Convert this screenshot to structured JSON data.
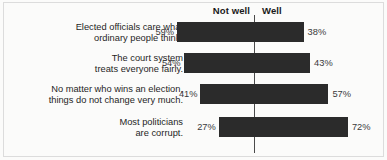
{
  "chart_data": {
    "type": "bar",
    "subtype": "diverging-horizontal",
    "title": "",
    "xlabel": "",
    "ylabel": "",
    "grid": false,
    "legend_position": "top",
    "axis_center_value": 0,
    "value_unit": "%",
    "headers": {
      "left": "Not well",
      "right": "Well"
    },
    "categories": [
      "Elected officials care what\nordinary people think.",
      "The court system\ntreats everyone fairly.",
      "No matter who wins an election,\nthings do not change very much.",
      "Most politicians\nare corrupt."
    ],
    "series": [
      {
        "name": "Not well",
        "values": [
          59,
          54,
          41,
          27
        ],
        "direction": "left",
        "color": "#2b2b2b"
      },
      {
        "name": "Well",
        "values": [
          38,
          43,
          57,
          72
        ],
        "direction": "right",
        "color": "#2b2b2b"
      }
    ],
    "labels": {
      "left": [
        "59%",
        "54%",
        "41%",
        "27%"
      ],
      "right": [
        "38%",
        "43%",
        "57%",
        "72%"
      ]
    },
    "rows": [
      {
        "label": "Elected officials care what\nordinary people think.",
        "left_value": 59,
        "left_label": "59%",
        "right_value": 38,
        "right_label": "38%"
      },
      {
        "label": "The court system\ntreats everyone fairly.",
        "left_value": 54,
        "left_label": "54%",
        "right_value": 43,
        "right_label": "43%"
      },
      {
        "label": "No matter who wins an election,\nthings do not change very much.",
        "left_value": 41,
        "left_label": "41%",
        "right_value": 57,
        "right_label": "57%"
      },
      {
        "label": "Most politicians\nare corrupt.",
        "left_value": 27,
        "left_label": "27%",
        "right_value": 72,
        "right_label": "72%"
      }
    ]
  },
  "style": {
    "bar_color": "#2b2b2b",
    "axis_color": "#4a4a4a",
    "background": "#fbfbfa",
    "text_color": "#1f1f1f"
  }
}
